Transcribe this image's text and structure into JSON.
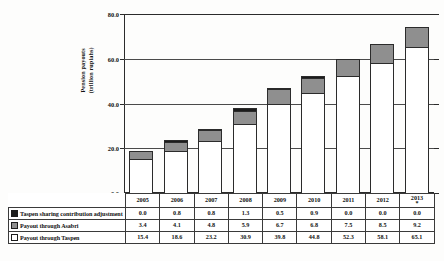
{
  "chart_data": {
    "type": "bar",
    "subtype": "stacked-column",
    "title": "",
    "xlabel": "",
    "ylabel": "Pension payouts\n(trillion rupiahs)",
    "ylabel_line1": "Pension payouts",
    "ylabel_line2": "(trillion rupiahs)",
    "ylim": [
      0.0,
      80.0
    ],
    "yticks": [
      "0.0",
      "20.0",
      "40.0",
      "60.0",
      "80.0"
    ],
    "ytick_values": [
      0.0,
      20.0,
      40.0,
      60.0,
      80.0
    ],
    "grid": true,
    "legend_position": "data-table-first-column",
    "categories": [
      "2005",
      "2006",
      "2007",
      "2008",
      "2009",
      "2010",
      "2011",
      "2012",
      "2013"
    ],
    "category_note_index": 8,
    "category_note": "*",
    "series": [
      {
        "name": "Taspen sharing contribution adjustment",
        "swatch": "s2",
        "color": "#1c1c1c",
        "values": [
          0.0,
          0.8,
          0.8,
          1.3,
          0.5,
          0.9,
          0.0,
          0.0,
          0.0
        ],
        "labels": [
          "0.0",
          "0.8",
          "0.8",
          "1.3",
          "0.5",
          "0.9",
          "0.0",
          "0.0",
          "0.0"
        ]
      },
      {
        "name": "Payout through Asabri",
        "swatch": "s1",
        "color": "#8f8f8f",
        "values": [
          3.4,
          4.1,
          4.8,
          5.9,
          6.7,
          6.8,
          7.5,
          8.5,
          9.2
        ],
        "labels": [
          "3.4",
          "4.1",
          "4.8",
          "5.9",
          "6.7",
          "6.8",
          "7.5",
          "8.5",
          "9.2"
        ]
      },
      {
        "name": "Payout through Taspen",
        "swatch": "s0",
        "color": "#ffffff",
        "values": [
          15.4,
          18.6,
          23.2,
          30.9,
          39.8,
          44.8,
          52.3,
          58.1,
          65.1
        ],
        "labels": [
          "15.4",
          "18.6",
          "23.2",
          "30.9",
          "39.8",
          "44.8",
          "52.3",
          "58.1",
          "65.1"
        ]
      }
    ],
    "totals": [
      18.8,
      23.5,
      28.8,
      38.1,
      47.0,
      52.5,
      59.8,
      66.6,
      74.3
    ]
  }
}
